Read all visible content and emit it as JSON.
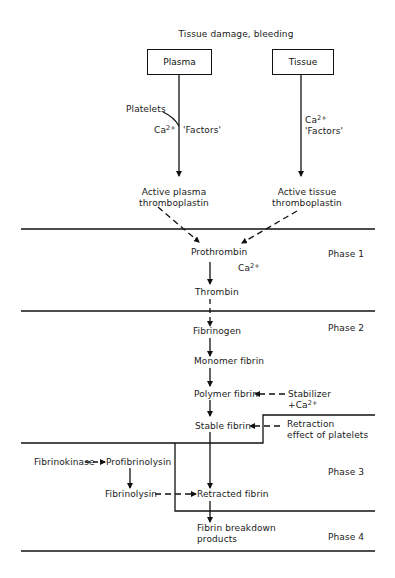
{
  "diagram": {
    "title": "Tissue damage, bleeding",
    "sources": {
      "plasma": "Plasma",
      "tissue": "Tissue"
    },
    "plasma_path": {
      "platelets": "Platelets",
      "ca": "Ca",
      "ca_sup": "2+",
      "factors": "'Factors'",
      "product_line1": "Active plasma",
      "product_line2": "thromboplastin"
    },
    "tissue_path": {
      "ca": "Ca",
      "ca_sup": "2+",
      "factors": "'Factors'",
      "product_line1": "Active tissue",
      "product_line2": "thromboplastin"
    },
    "phase1": {
      "label": "Phase 1",
      "prothrombin": "Prothrombin",
      "ca": "Ca",
      "ca_sup": "2+",
      "thrombin": "Thrombin"
    },
    "phase2": {
      "label": "Phase 2",
      "fibrinogen": "Fibrinogen",
      "monomer": "Monomer fibrin",
      "polymer": "Polymer fibrin",
      "stabilizer_line1": "Stabilizer",
      "stabilizer_line2": "+Ca",
      "stabilizer_sup": "2+",
      "stable": "Stable fibrin",
      "retraction_line1": "Retraction",
      "retraction_line2": "effect of platelets"
    },
    "phase3": {
      "label": "Phase 3",
      "fibrinokinase": "Fibrinokinase",
      "profibrinolysin": "Profibrinolysin",
      "fibrinolysin": "Fibrinolysin",
      "retracted": "Retracted fibrin"
    },
    "phase4": {
      "label": "Phase 4",
      "breakdown_line1": "Fibrin breakdown",
      "breakdown_line2": "products"
    },
    "colors": {
      "ink": "#111111",
      "background": "#ffffff"
    }
  }
}
